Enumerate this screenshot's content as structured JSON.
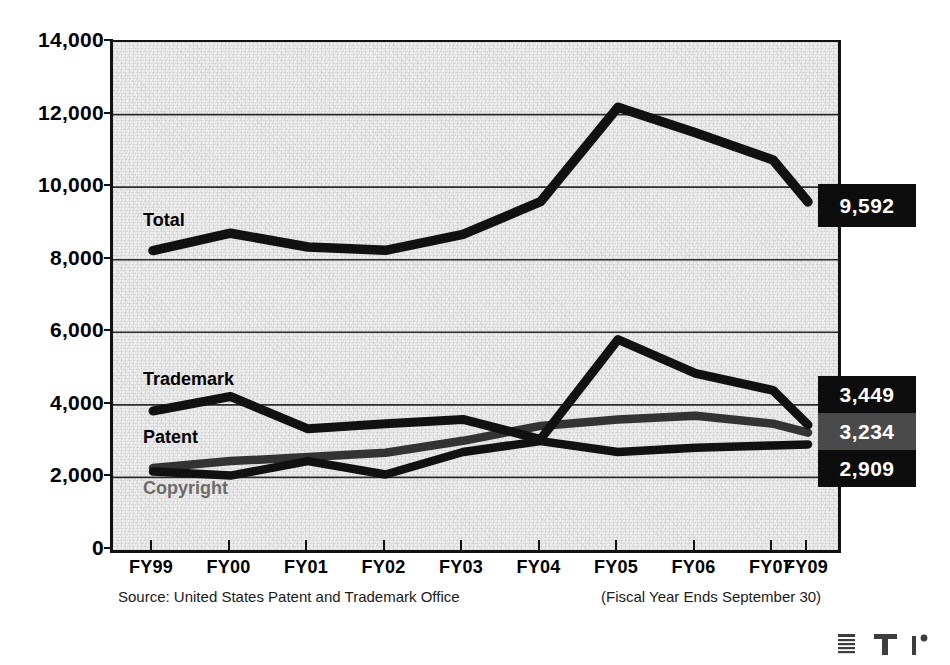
{
  "chart_data": {
    "type": "line",
    "title": "",
    "subtitle": "",
    "xlabel": "",
    "ylabel": "",
    "categories": [
      "FY99",
      "FY00",
      "FY01",
      "FY02",
      "FY03",
      "FY04",
      "FY05",
      "FY06",
      "FY07",
      "FY09"
    ],
    "ylim": [
      0,
      14000
    ],
    "ytick_labels": [
      "0",
      "2,000",
      "4,000",
      "6,000",
      "8,000",
      "10,000",
      "12,000",
      "14,000"
    ],
    "ytick_values": [
      0,
      2000,
      4000,
      6000,
      8000,
      10000,
      12000,
      14000
    ],
    "grid": "horizontal",
    "legend_position": "inline-annotations",
    "series": [
      {
        "name": "Total",
        "color": "#111111",
        "values": [
          8250,
          8730,
          8350,
          8260,
          8700,
          9600,
          12200,
          11500,
          10750,
          9592
        ],
        "end_label": "9,592"
      },
      {
        "name": "Trademark",
        "color": "#111111",
        "values": [
          3830,
          4230,
          3340,
          3480,
          3600,
          3050,
          5800,
          4870,
          4400,
          3449
        ],
        "end_label": "3,449"
      },
      {
        "name": "Patent",
        "color": "#333333",
        "values": [
          2260,
          2450,
          2560,
          2680,
          3010,
          3420,
          3600,
          3700,
          3480,
          3234
        ],
        "end_label": "3,234"
      },
      {
        "name": "Copyright",
        "color": "#111111",
        "values": [
          2160,
          2050,
          2450,
          2080,
          2700,
          3000,
          2700,
          2820,
          2880,
          2909
        ],
        "end_label": "2,909"
      }
    ],
    "annotations": [
      {
        "text": "Total",
        "series": "Total"
      },
      {
        "text": "Trademark",
        "series": "Trademark"
      },
      {
        "text": "Patent",
        "series": "Patent"
      },
      {
        "text": "Copyright",
        "series": "Copyright"
      }
    ],
    "source": "Source: United States Patent and Trademark Office",
    "note": "(Fiscal Year Ends September 30)"
  },
  "yaxis": {
    "ticks": [
      {
        "label": "14,000",
        "value": 14000
      },
      {
        "label": "12,000",
        "value": 12000
      },
      {
        "label": "10,000",
        "value": 10000
      },
      {
        "label": "8,000",
        "value": 8000
      },
      {
        "label": "6,000",
        "value": 6000
      },
      {
        "label": "4,000",
        "value": 4000
      },
      {
        "label": "2,000",
        "value": 2000
      },
      {
        "label": "0",
        "value": 0
      }
    ]
  },
  "xaxis": {
    "ticks": [
      {
        "label": "FY99"
      },
      {
        "label": "FY00"
      },
      {
        "label": "FY01"
      },
      {
        "label": "FY02"
      },
      {
        "label": "FY03"
      },
      {
        "label": "FY04"
      },
      {
        "label": "FY05"
      },
      {
        "label": "FY06"
      },
      {
        "label": "FY07"
      },
      {
        "label": "FY09"
      }
    ]
  },
  "series_tags": {
    "total": "Total",
    "trademark": "Trademark",
    "patent": "Patent",
    "copyright": "Copyright"
  },
  "value_boxes": [
    {
      "label": "9,592",
      "background": "#0d0d0d"
    },
    {
      "label": "3,449",
      "background": "#0d0d0d"
    },
    {
      "label": "3,234",
      "background": "#4a4a4a"
    },
    {
      "label": "2,909",
      "background": "#0d0d0d"
    }
  ],
  "footnotes": {
    "source": "Source: United States Patent and Trademark Office",
    "fiscal": "(Fiscal Year Ends September 30)"
  },
  "colors": {
    "plot_background": "#e9e9e9",
    "axis": "#111111",
    "gridline": "#2b2b2b",
    "line_dark": "#111111",
    "line_gray": "#4a4a4a",
    "muted_text": "#6b6b6b"
  }
}
